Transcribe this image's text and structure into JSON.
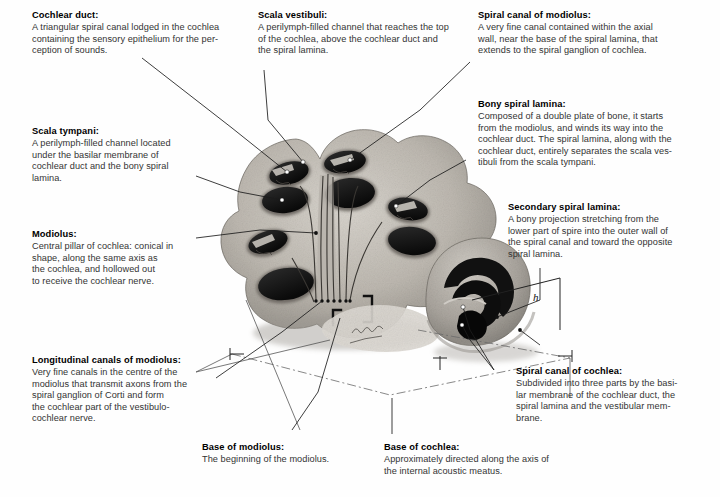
{
  "figure": {
    "style": "grayscale-anatomical-illustration",
    "background_color": "#ffffff",
    "line_color": "#1a1a1a",
    "dimension_label_h": "h",
    "signature": "artist-signature"
  },
  "notes": [
    {
      "id": "cochlear-duct",
      "title": "Cochlear duct:",
      "body": "A triangular spiral canal lodged in the cochlea\ncontaining the sensory epithelium for the per-\nception of sounds."
    },
    {
      "id": "scala-vestibuli",
      "title": "Scala vestibuli:",
      "body": "A perilymph-filled channel that reaches the top\nof the cochlea, above the cochlear duct and\nthe spiral lamina."
    },
    {
      "id": "spiral-canal-of-modiolus",
      "title": "Spiral canal of modiolus:",
      "body": "A very fine canal contained within the axial\nwall, near the base of the spiral lamina, that\nextends to the spiral ganglion of cochlea."
    },
    {
      "id": "bony-spiral-lamina",
      "title": "Bony spiral lamina:",
      "body": "Composed of a double plate of bone, it starts\nfrom the modiolus, and winds its way into the\ncochlear duct. The spiral lamina, along with the\ncochlear duct, entirely separates the scala ves-\ntibuli from the scala tympani."
    },
    {
      "id": "scala-tympani",
      "title": "Scala tympani:",
      "body": "A perilymph-filled channel located\nunder the basilar membrane of\ncochlear duct and the bony spiral\nlamina."
    },
    {
      "id": "secondary-spiral-lamina",
      "title": "Secondary spiral lamina:",
      "body": "A bony projection stretching from the\nlower part of spire into the outer wall of\nthe spiral canal and toward the opposite\nspiral lamina."
    },
    {
      "id": "modiolus",
      "title": "Modiolus:",
      "body": "Central pillar of cochlea: conical in\nshape, along the same axis as\nthe cochlea, and hollowed out\nto receive the cochlear nerve."
    },
    {
      "id": "longitudinal-canals-of-modiolus",
      "title": "Longitudinal canals of modiolus:",
      "body": "Very fine canals in the centre of the\nmodiolus that transmit axons from the\nspiral ganglion of Corti and form\nthe cochlear part of the vestibulo-\ncochlear nerve."
    },
    {
      "id": "spiral-canal-of-cochlea",
      "title": "Spiral canal of cochlea:",
      "body": "Subdivided into three parts by the basi-\nlar membrane of the cochlear duct, the\nspiral lamina and the vestibular mem-\nbrane."
    },
    {
      "id": "base-of-modiolus",
      "title": "Base of modiolus:",
      "body": "The beginning of the modiolus."
    },
    {
      "id": "base-of-cochlea",
      "title": "Base of cochlea:",
      "body": "Approximately directed along the axis of\nthe internal acoustic meatus."
    }
  ]
}
